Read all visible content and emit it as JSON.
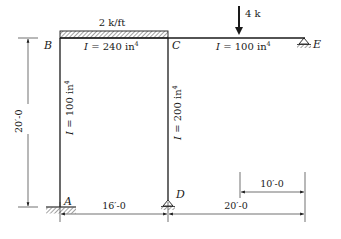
{
  "diagram": {
    "type": "structural-frame",
    "nodes": {
      "A": {
        "label": "A",
        "support": "fixed"
      },
      "B": {
        "label": "B",
        "support": "none"
      },
      "C": {
        "label": "C",
        "support": "none"
      },
      "D": {
        "label": "D",
        "support": "pin"
      },
      "E": {
        "label": "E",
        "support": "pin"
      }
    },
    "members": {
      "BC": {
        "I_label_prefix": "I",
        "I_label_eq": " = 240 in",
        "I_exp": "4"
      },
      "CE": {
        "I_label_prefix": "I",
        "I_label_eq": " = 100 in",
        "I_exp": "4"
      },
      "AB": {
        "I_label_prefix": "I",
        "I_label_eq": " = 100 in",
        "I_exp": "4"
      },
      "CD": {
        "I_label_prefix": "I",
        "I_label_eq": " = 200 in",
        "I_exp": "4"
      }
    },
    "loads": {
      "distributed": {
        "label": "2 k/ft",
        "span": "BC"
      },
      "point": {
        "label": "4 k",
        "member": "CE"
      }
    },
    "dimensions": {
      "height": "20′-0",
      "span_AD": "16′-0",
      "span_DE": "20′-0",
      "load_to_E": "10′-0"
    },
    "colors": {
      "ink": "#1a1a1a",
      "background": "#ffffff"
    }
  }
}
